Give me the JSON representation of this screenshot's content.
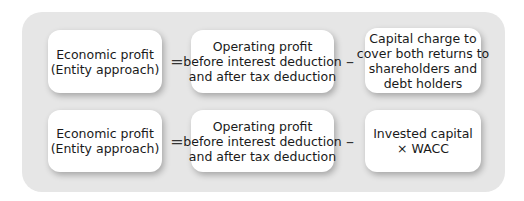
{
  "diagram": {
    "rows": [
      {
        "lhs": [
          "Economic profit",
          "(Entity approach)"
        ],
        "op1": "=",
        "mid": [
          "Operating profit",
          "before interest deduction",
          "and after tax deduction"
        ],
        "op2": "–",
        "rhs": [
          "Capital charge to",
          "cover both returns to",
          "shareholders and",
          "debt holders"
        ]
      },
      {
        "lhs": [
          "Economic profit",
          "(Entity approach)"
        ],
        "op1": "=",
        "mid": [
          "Operating profit",
          "before interest deduction",
          "and after tax deduction"
        ],
        "op2": "–",
        "rhs": [
          "Invested capital",
          "× WACC"
        ]
      }
    ],
    "colors": {
      "panel": "#e6e6e6",
      "box": "#ffffff",
      "text": "#1a1a1a"
    }
  }
}
